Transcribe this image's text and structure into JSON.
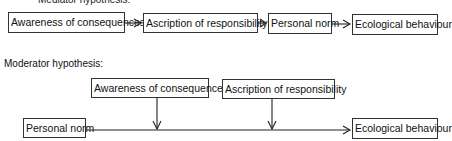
{
  "mediator": {
    "heading_partial": "Mediator hypothesis:",
    "nodes": [
      {
        "label": "Awareness of consequences"
      },
      {
        "label": "Ascription of responsibility"
      },
      {
        "label": "Personal norm"
      },
      {
        "label": "Ecological behaviour"
      }
    ]
  },
  "moderator": {
    "heading": "Moderator hypothesis:",
    "moderators": [
      {
        "label": "Awareness of consequences"
      },
      {
        "label": "Ascription of responsibility"
      }
    ],
    "source": {
      "label": "Personal norm"
    },
    "target": {
      "label": "Ecological behaviour"
    }
  },
  "colors": {
    "line": "#222222",
    "border": "#333333",
    "background": "#ffffff"
  }
}
